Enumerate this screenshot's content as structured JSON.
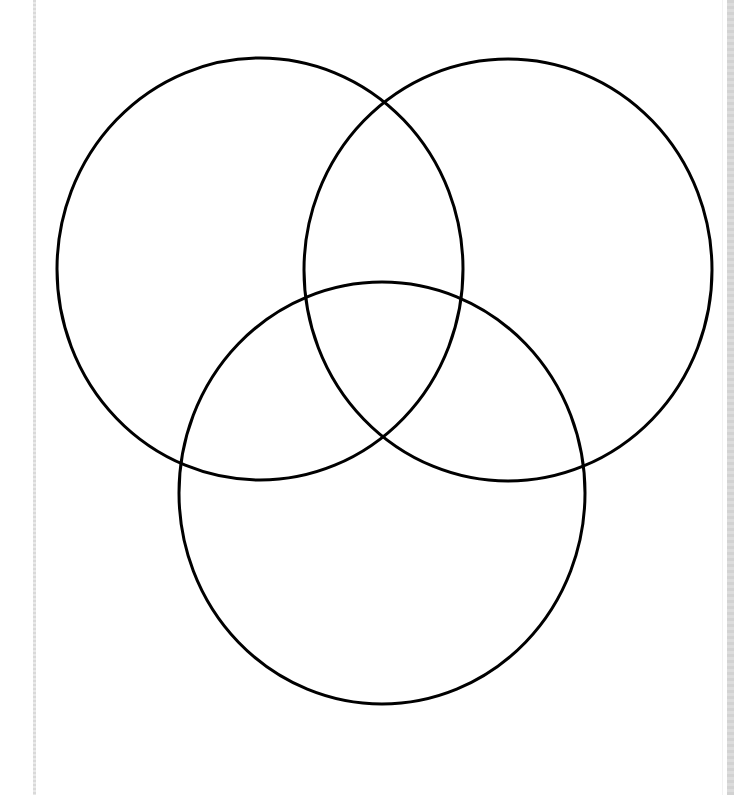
{
  "diagram": {
    "type": "venn",
    "title": "",
    "set_count": 3,
    "stroke_color": "#000000",
    "stroke_width": 3,
    "fill": "none",
    "background": "#ffffff",
    "sets": [
      {
        "name": "circle-top-left",
        "label": "",
        "cx": 260,
        "cy": 269,
        "rx": 203,
        "ry": 211
      },
      {
        "name": "circle-top-right",
        "label": "",
        "cx": 508,
        "cy": 270,
        "rx": 204,
        "ry": 211
      },
      {
        "name": "circle-bottom",
        "label": "",
        "cx": 382,
        "cy": 493,
        "rx": 203,
        "ry": 211
      }
    ],
    "region_labels": []
  },
  "frame": {
    "left_rule_color": "#d9d9d9",
    "right_strip_color": "#d2d2d2"
  }
}
